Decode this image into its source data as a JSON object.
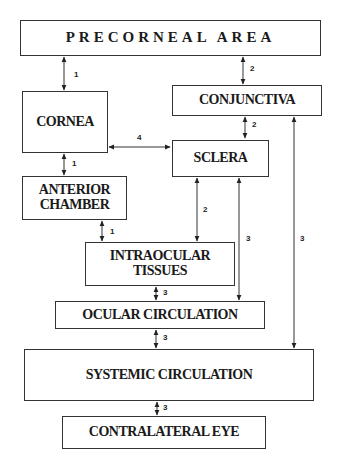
{
  "nodes": {
    "precorneal": "PRECORNEAL AREA",
    "cornea": "CORNEA",
    "conjunctiva": "CONJUNCTIVA",
    "sclera": "SCLERA",
    "anterior_chamber_1": "ANTERIOR",
    "anterior_chamber_2": "CHAMBER",
    "intraocular_1": "INTRAOCULAR",
    "intraocular_2": "TISSUES",
    "ocular_circulation": "OCULAR CIRCULATION",
    "systemic_circulation": "SYSTEMIC CIRCULATION",
    "contralateral_eye": "CONTRALATERAL EYE"
  },
  "edges": [
    {
      "from": "precorneal",
      "to": "cornea",
      "label": "1",
      "bidirectional": true
    },
    {
      "from": "precorneal",
      "to": "conjunctiva",
      "label": "2",
      "bidirectional": true
    },
    {
      "from": "conjunctiva",
      "to": "sclera",
      "label": "2",
      "bidirectional": true
    },
    {
      "from": "cornea",
      "to": "sclera",
      "label": "4",
      "bidirectional": true
    },
    {
      "from": "cornea",
      "to": "anterior_chamber",
      "label": "1",
      "bidirectional": true
    },
    {
      "from": "anterior_chamber",
      "to": "intraocular_tissues",
      "label": "1",
      "bidirectional": true
    },
    {
      "from": "sclera",
      "to": "intraocular_tissues",
      "label": "2",
      "bidirectional": true
    },
    {
      "from": "sclera",
      "to": "ocular_circulation",
      "label": "3",
      "bidirectional": true
    },
    {
      "from": "conjunctiva",
      "to": "systemic_circulation",
      "label": "3",
      "bidirectional": true
    },
    {
      "from": "intraocular_tissues",
      "to": "ocular_circulation",
      "label": "3",
      "bidirectional": true
    },
    {
      "from": "ocular_circulation",
      "to": "systemic_circulation",
      "label": "3",
      "bidirectional": true
    },
    {
      "from": "systemic_circulation",
      "to": "contralateral_eye",
      "label": "3",
      "bidirectional": true
    }
  ],
  "labels": {
    "e1": "1",
    "e2": "2",
    "e3": "2",
    "e4": "4",
    "e5": "1",
    "e6": "1",
    "e7": "2",
    "e8": "3",
    "e9": "3",
    "e10": "3",
    "e11": "3",
    "e12": "3"
  }
}
